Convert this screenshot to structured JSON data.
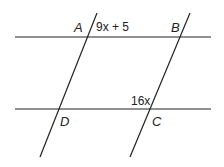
{
  "diagram": {
    "points": {
      "A": "A",
      "B": "B",
      "C": "C",
      "D": "D"
    },
    "angle_labels": {
      "top": "9x + 5",
      "bottom": "16x"
    },
    "line_color": "#222222"
  }
}
